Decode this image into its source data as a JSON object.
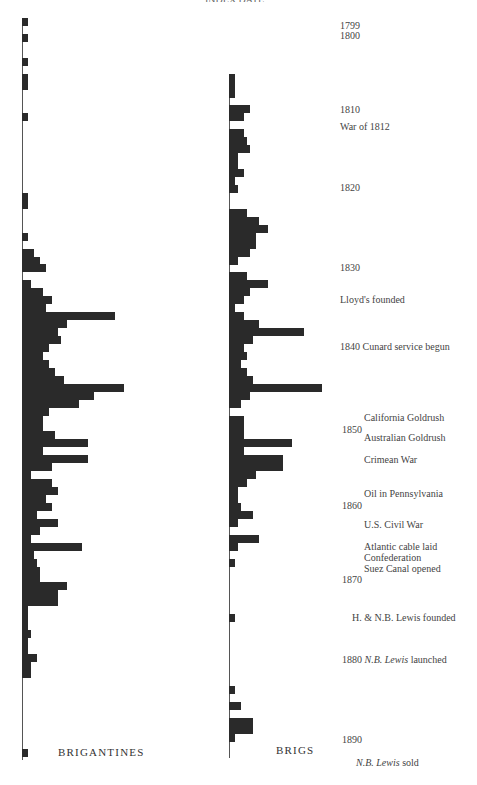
{
  "chart_data": {
    "type": "bar",
    "orientation": "horizontal",
    "title": "",
    "xlabel": "Number of vessels (relative)",
    "ylabel": "Year",
    "ylim": [
      1799,
      1892
    ],
    "grid": false,
    "legend_position": "bottom",
    "series": [
      {
        "name": "BRIGANTINES",
        "note": "values are approximate bar lengths (pixel-relative units, 1 unit ≈ 3px)",
        "points": [
          {
            "year": 1799,
            "value": 2
          },
          {
            "year": 1800,
            "value": 0
          },
          {
            "year": 1801,
            "value": 2
          },
          {
            "year": 1804,
            "value": 2
          },
          {
            "year": 1806,
            "value": 2
          },
          {
            "year": 1807,
            "value": 2
          },
          {
            "year": 1811,
            "value": 2
          },
          {
            "year": 1816,
            "value": 0
          },
          {
            "year": 1821,
            "value": 2
          },
          {
            "year": 1822,
            "value": 2
          },
          {
            "year": 1826,
            "value": 2
          },
          {
            "year": 1828,
            "value": 4
          },
          {
            "year": 1829,
            "value": 6
          },
          {
            "year": 1830,
            "value": 8
          },
          {
            "year": 1832,
            "value": 3
          },
          {
            "year": 1833,
            "value": 7
          },
          {
            "year": 1834,
            "value": 10
          },
          {
            "year": 1835,
            "value": 8
          },
          {
            "year": 1836,
            "value": 31
          },
          {
            "year": 1837,
            "value": 15
          },
          {
            "year": 1838,
            "value": 12
          },
          {
            "year": 1839,
            "value": 13
          },
          {
            "year": 1840,
            "value": 9
          },
          {
            "year": 1841,
            "value": 7
          },
          {
            "year": 1842,
            "value": 9
          },
          {
            "year": 1843,
            "value": 11
          },
          {
            "year": 1844,
            "value": 14
          },
          {
            "year": 1845,
            "value": 34
          },
          {
            "year": 1846,
            "value": 24
          },
          {
            "year": 1847,
            "value": 19
          },
          {
            "year": 1848,
            "value": 9
          },
          {
            "year": 1849,
            "value": 7
          },
          {
            "year": 1850,
            "value": 7
          },
          {
            "year": 1851,
            "value": 11
          },
          {
            "year": 1852,
            "value": 22
          },
          {
            "year": 1853,
            "value": 7
          },
          {
            "year": 1854,
            "value": 22
          },
          {
            "year": 1855,
            "value": 10
          },
          {
            "year": 1856,
            "value": 3
          },
          {
            "year": 1857,
            "value": 10
          },
          {
            "year": 1858,
            "value": 12
          },
          {
            "year": 1859,
            "value": 8
          },
          {
            "year": 1860,
            "value": 10
          },
          {
            "year": 1861,
            "value": 5
          },
          {
            "year": 1862,
            "value": 12
          },
          {
            "year": 1863,
            "value": 6
          },
          {
            "year": 1864,
            "value": 3
          },
          {
            "year": 1865,
            "value": 20
          },
          {
            "year": 1866,
            "value": 4
          },
          {
            "year": 1867,
            "value": 5
          },
          {
            "year": 1868,
            "value": 6
          },
          {
            "year": 1869,
            "value": 6
          },
          {
            "year": 1870,
            "value": 15
          },
          {
            "year": 1871,
            "value": 12
          },
          {
            "year": 1872,
            "value": 12
          },
          {
            "year": 1873,
            "value": 2
          },
          {
            "year": 1874,
            "value": 2
          },
          {
            "year": 1875,
            "value": 2
          },
          {
            "year": 1876,
            "value": 3
          },
          {
            "year": 1877,
            "value": 2
          },
          {
            "year": 1878,
            "value": 2
          },
          {
            "year": 1879,
            "value": 5
          },
          {
            "year": 1880,
            "value": 3
          },
          {
            "year": 1881,
            "value": 3
          },
          {
            "year": 1891,
            "value": 2
          }
        ]
      },
      {
        "name": "BRIGS",
        "note": "values are approximate bar lengths (pixel-relative units, 1 unit ≈ 3px)",
        "points": [
          {
            "year": 1806,
            "value": 2
          },
          {
            "year": 1807,
            "value": 2
          },
          {
            "year": 1808,
            "value": 2
          },
          {
            "year": 1810,
            "value": 7
          },
          {
            "year": 1811,
            "value": 5
          },
          {
            "year": 1813,
            "value": 5
          },
          {
            "year": 1814,
            "value": 6
          },
          {
            "year": 1815,
            "value": 7
          },
          {
            "year": 1816,
            "value": 3
          },
          {
            "year": 1817,
            "value": 3
          },
          {
            "year": 1818,
            "value": 5
          },
          {
            "year": 1819,
            "value": 2
          },
          {
            "year": 1820,
            "value": 3
          },
          {
            "year": 1823,
            "value": 6
          },
          {
            "year": 1824,
            "value": 10
          },
          {
            "year": 1825,
            "value": 13
          },
          {
            "year": 1826,
            "value": 9
          },
          {
            "year": 1827,
            "value": 9
          },
          {
            "year": 1828,
            "value": 7
          },
          {
            "year": 1829,
            "value": 3
          },
          {
            "year": 1831,
            "value": 6
          },
          {
            "year": 1832,
            "value": 13
          },
          {
            "year": 1833,
            "value": 7
          },
          {
            "year": 1834,
            "value": 5
          },
          {
            "year": 1835,
            "value": 2
          },
          {
            "year": 1836,
            "value": 5
          },
          {
            "year": 1837,
            "value": 10
          },
          {
            "year": 1838,
            "value": 25
          },
          {
            "year": 1839,
            "value": 8
          },
          {
            "year": 1840,
            "value": 5
          },
          {
            "year": 1841,
            "value": 6
          },
          {
            "year": 1842,
            "value": 4
          },
          {
            "year": 1843,
            "value": 6
          },
          {
            "year": 1844,
            "value": 8
          },
          {
            "year": 1845,
            "value": 31
          },
          {
            "year": 1846,
            "value": 7
          },
          {
            "year": 1847,
            "value": 4
          },
          {
            "year": 1849,
            "value": 5
          },
          {
            "year": 1850,
            "value": 5
          },
          {
            "year": 1851,
            "value": 5
          },
          {
            "year": 1852,
            "value": 21
          },
          {
            "year": 1853,
            "value": 5
          },
          {
            "year": 1854,
            "value": 18
          },
          {
            "year": 1855,
            "value": 18
          },
          {
            "year": 1856,
            "value": 9
          },
          {
            "year": 1857,
            "value": 6
          },
          {
            "year": 1858,
            "value": 3
          },
          {
            "year": 1859,
            "value": 3
          },
          {
            "year": 1860,
            "value": 4
          },
          {
            "year": 1861,
            "value": 8
          },
          {
            "year": 1862,
            "value": 3
          },
          {
            "year": 1864,
            "value": 10
          },
          {
            "year": 1865,
            "value": 3
          },
          {
            "year": 1867,
            "value": 2
          },
          {
            "year": 1874,
            "value": 2
          },
          {
            "year": 1883,
            "value": 2
          },
          {
            "year": 1885,
            "value": 4
          },
          {
            "year": 1887,
            "value": 8
          },
          {
            "year": 1888,
            "value": 8
          },
          {
            "year": 1889,
            "value": 2
          }
        ]
      }
    ],
    "annotations": [
      {
        "year": 1799,
        "text": "1799"
      },
      {
        "year": 1800,
        "text": "1800"
      },
      {
        "year": 1810,
        "text": "1810"
      },
      {
        "year": 1812,
        "text": "War of 1812"
      },
      {
        "year": 1820,
        "text": "1820"
      },
      {
        "year": 1830,
        "text": "1830"
      },
      {
        "year": 1834,
        "text": "Lloyd's founded"
      },
      {
        "year": 1840,
        "text": "1840 Cunard service begun"
      },
      {
        "year": 1848,
        "text": "California Goldrush"
      },
      {
        "year": 1850,
        "text": "1850"
      },
      {
        "year": 1851,
        "text": "Australian Goldrush"
      },
      {
        "year": 1854,
        "text": "Crimean War"
      },
      {
        "year": 1859,
        "text": "Oil in Pennsylvania"
      },
      {
        "year": 1860,
        "text": "1860"
      },
      {
        "year": 1862,
        "text": "U.S. Civil War"
      },
      {
        "year": 1865,
        "text": "Atlantic cable laid"
      },
      {
        "year": 1867,
        "text": "Confederation"
      },
      {
        "year": 1869,
        "text": "Suez Canal opened"
      },
      {
        "year": 1870,
        "text": "1870"
      },
      {
        "year": 1875,
        "text": "H. & N.B. Lewis founded"
      },
      {
        "year": 1880,
        "text": "1880 N.B. Lewis launched"
      },
      {
        "year": 1890,
        "text": "1890"
      },
      {
        "year": 1892,
        "text": "N.B. Lewis sold"
      }
    ]
  },
  "labels": {
    "top_cut": "INDEX DATE",
    "brigantines": "BRIGANTINES",
    "brigs": "BRIGS",
    "y1799": "1799",
    "y1800": "1800",
    "y1810": "1810",
    "war1812": "War of 1812",
    "y1820": "1820",
    "y1830": "1830",
    "lloyds": "Lloyd's founded",
    "cunard": "1840 Cunard service begun",
    "california": "California Goldrush",
    "y1850": "1850",
    "australian": "Australian Goldrush",
    "crimean": "Crimean War",
    "oil": "Oil in Pennsylvania",
    "y1860": "1860",
    "civilwar": "U.S. Civil War",
    "cable": "Atlantic cable laid",
    "confederation": "Confederation",
    "suez": "Suez Canal opened",
    "y1870": "1870",
    "lewis_founded": "H. & N.B. Lewis founded",
    "launched_year": "1880",
    "launched_name": "N.B. Lewis",
    "launched_text": "launched",
    "y1890": "1890",
    "sold_name": "N.B. Lewis",
    "sold_text": "sold"
  }
}
